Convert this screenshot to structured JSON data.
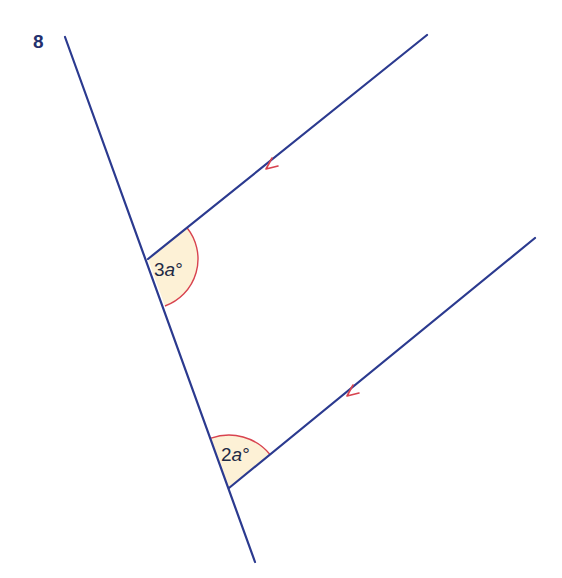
{
  "question": {
    "number": "8"
  },
  "diagram": {
    "colors": {
      "line": "#2b3a8f",
      "arc": "#d8434f",
      "angle_fill": "#fdf1d6",
      "arrow": "#d8434f"
    },
    "transversal": {
      "x1": 65,
      "y1": 37,
      "x2": 255,
      "y2": 562
    },
    "parallel_lines": [
      {
        "name": "upper",
        "x1": 148,
        "y1": 259,
        "x2": 427,
        "y2": 35
      },
      {
        "name": "lower",
        "x1": 229,
        "y1": 488,
        "x2": 535,
        "y2": 238
      }
    ],
    "angles": [
      {
        "label_coef": "3",
        "label_var": "a",
        "label_unit": "°",
        "vertex": [
          148,
          259
        ]
      },
      {
        "label_coef": "2",
        "label_var": "a",
        "label_unit": "°",
        "vertex": [
          229,
          488
        ]
      }
    ],
    "parallel_marker": "single-arrow"
  }
}
